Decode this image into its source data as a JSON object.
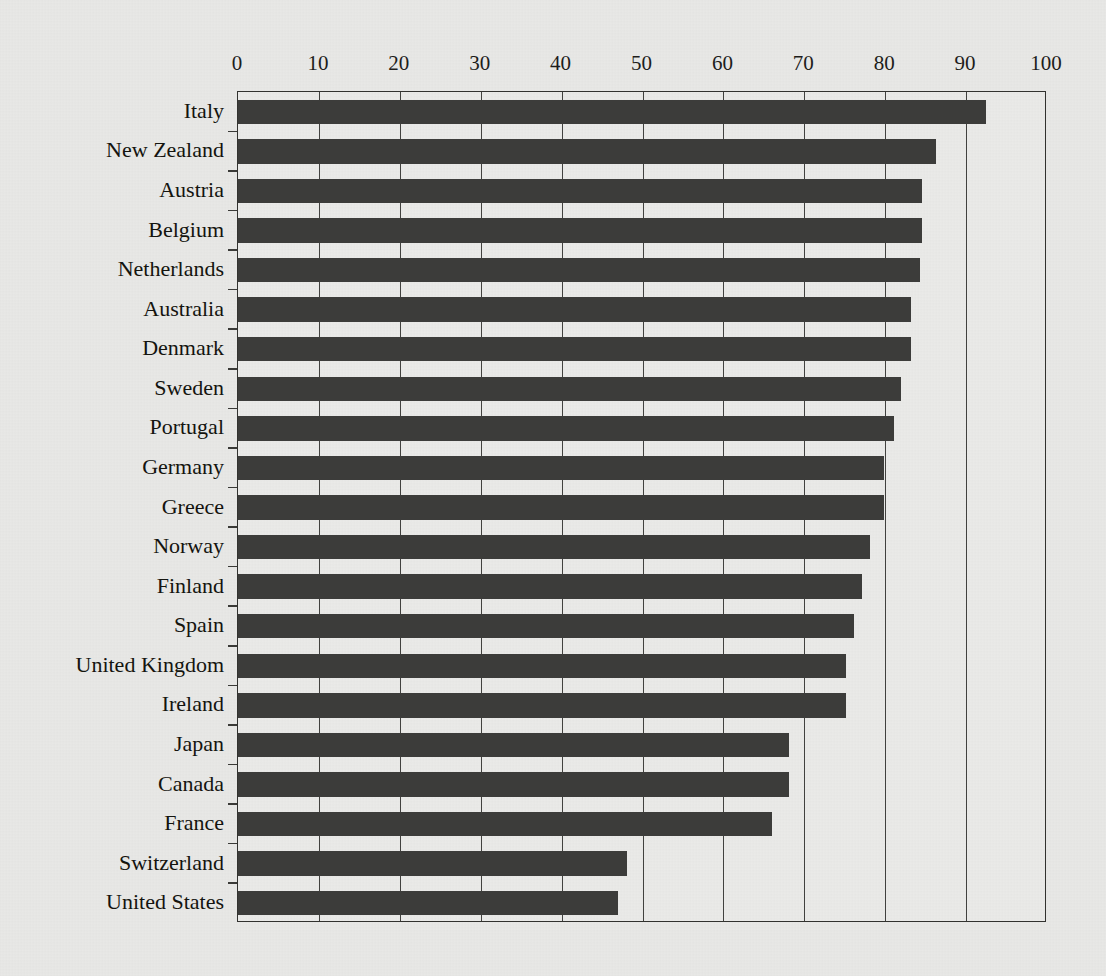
{
  "chart": {
    "type": "bar",
    "orientation": "horizontal",
    "title": "",
    "subtitle": "",
    "xlabel": "",
    "ylabel": "",
    "xlim": [
      0,
      100
    ],
    "xticks": [
      0,
      10,
      20,
      30,
      40,
      50,
      60,
      70,
      80,
      90,
      100
    ],
    "grid": "vertical",
    "legend": "none",
    "bar_color": "#3c3c3a",
    "background_color": "#e8e8e6",
    "plot_background_color": "#eaeae8",
    "axis_color": "#32322f"
  },
  "chart_data": {
    "type": "bar",
    "title": "",
    "xlabel": "",
    "ylabel": "",
    "xlim": [
      0,
      100
    ],
    "xticks": [
      0,
      10,
      20,
      30,
      40,
      50,
      60,
      70,
      80,
      90,
      100
    ],
    "grid": true,
    "legend_position": "none",
    "orientation": "horizontal",
    "categories": [
      "Italy",
      "New Zealand",
      "Austria",
      "Belgium",
      "Netherlands",
      "Australia",
      "Denmark",
      "Sweden",
      "Portugal",
      "Germany",
      "Greece",
      "Norway",
      "Finland",
      "Spain",
      "United Kingdom",
      "Ireland",
      "Japan",
      "Canada",
      "France",
      "Switzerland",
      "United States"
    ],
    "values": [
      92.5,
      86.3,
      84.6,
      84.6,
      84.3,
      83.2,
      83.2,
      82.0,
      81.1,
      79.9,
      79.9,
      78.1,
      77.1,
      76.1,
      75.1,
      75.1,
      68.1,
      68.1,
      66.0,
      48.1,
      47.0
    ]
  }
}
